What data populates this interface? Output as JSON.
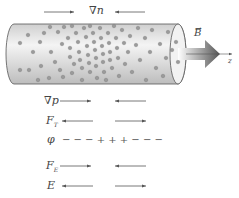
{
  "top_label": "∇n",
  "field_label": "B",
  "axis_label": "z",
  "rows": [
    {
      "label": "∇p",
      "left": "right",
      "right": "left"
    },
    {
      "label": "F",
      "sub": "T",
      "left": "left",
      "right": "right"
    },
    {
      "label": "φ",
      "charges": "− − − + + + − − −"
    },
    {
      "label": "F",
      "sub": "E",
      "left": "right",
      "right": "left"
    },
    {
      "label": "E",
      "left": "left",
      "right": "right"
    }
  ],
  "colors": {
    "cylinder": "#e8e8e8",
    "particle": "#8a8a8a",
    "arrow": "#555555"
  }
}
